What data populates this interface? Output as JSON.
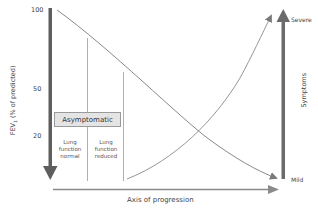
{
  "diagram": {
    "left_axis": {
      "label_main": "FEV",
      "label_sub": "1",
      "label_rest": " (% of predicted)",
      "ticks": [
        "100",
        "50",
        "20"
      ]
    },
    "right_axis": {
      "label": "Symptoms",
      "top_label": "Severe",
      "bottom_label": "Mild"
    },
    "x_axis": {
      "label": "Axis of progression"
    },
    "box": {
      "label": "Asymptomatic"
    },
    "phases": [
      {
        "label": "Lung function normal"
      },
      {
        "label": "Lung function reduced"
      }
    ],
    "curves": [
      {
        "name": "FEV1 decline",
        "shape": "descending",
        "from": "100% at start",
        "to": "Mild end"
      },
      {
        "name": "Symptoms increase",
        "shape": "rising",
        "from": "after reduced lung function",
        "to": "Severe"
      }
    ],
    "colors": {
      "axis_arrow": "#6b6b6b",
      "curve_line": "#8a8a8a",
      "box_fill": "#e4e4e4",
      "text": "#444444"
    }
  }
}
